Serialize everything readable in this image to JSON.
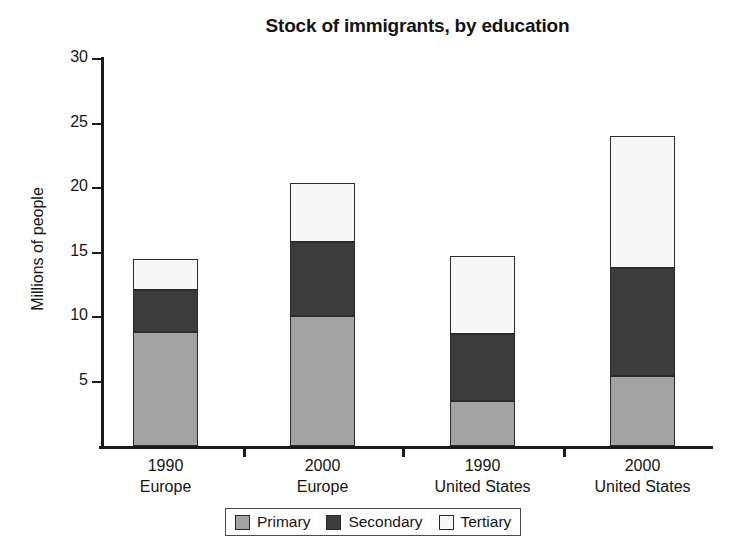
{
  "chart_data": {
    "type": "bar",
    "subtype": "stacked-bar",
    "title": "Stock of immigrants, by education",
    "xlabel": "",
    "ylabel": "Millions of people",
    "ylim": [
      0,
      30
    ],
    "yticks": [
      5,
      10,
      15,
      20,
      25,
      30
    ],
    "ytick_labels": [
      "5",
      "10",
      "15",
      "20",
      "25",
      "30"
    ],
    "grid": false,
    "legend_position": "bottom-center",
    "categories": [
      "1990 Europe",
      "2000 Europe",
      "1990 United States",
      "2000 United States"
    ],
    "category_lines": [
      {
        "year": "1990",
        "region": "Europe"
      },
      {
        "year": "2000",
        "region": "Europe"
      },
      {
        "year": "1990",
        "region": "United States"
      },
      {
        "year": "2000",
        "region": "United States"
      }
    ],
    "series": [
      {
        "name": "Primary",
        "color": "#a3a3a3",
        "values": [
          8.8,
          10.1,
          3.5,
          5.4
        ]
      },
      {
        "name": "Secondary",
        "color": "#3d3d3d",
        "values": [
          3.3,
          5.7,
          5.2,
          8.4
        ]
      },
      {
        "name": "Tertiary",
        "color": "#f7f7f7",
        "values": [
          2.4,
          4.6,
          6.0,
          10.2
        ]
      }
    ],
    "totals": [
      14.5,
      20.4,
      14.7,
      24.0
    ],
    "cumulative_boundaries": [
      [
        8.8,
        12.1,
        14.5
      ],
      [
        10.1,
        15.8,
        20.4
      ],
      [
        3.5,
        8.7,
        14.7
      ],
      [
        5.4,
        13.8,
        24.0
      ]
    ]
  },
  "legend": {
    "items": [
      {
        "label": "Primary",
        "color": "#a3a3a3"
      },
      {
        "label": "Secondary",
        "color": "#3d3d3d"
      },
      {
        "label": "Tertiary",
        "color": "#f7f7f7"
      }
    ]
  },
  "footer": {
    "note": ""
  }
}
